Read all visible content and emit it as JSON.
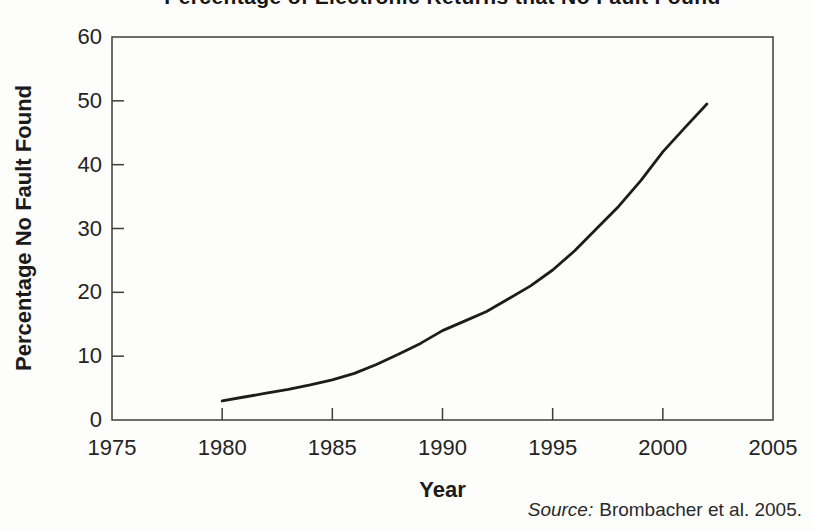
{
  "figure": {
    "kind": "scanned-book-line-chart"
  },
  "source": {
    "label": "Source:",
    "text": "Brombacher et al. 2005."
  },
  "chart_data": {
    "type": "line",
    "title": "Percentage of Electronic Returns that No Fault Found",
    "xlabel": "Year",
    "ylabel": "Percentage No Fault Found",
    "xlim": [
      1975,
      2005
    ],
    "ylim": [
      0,
      60
    ],
    "x_ticks": [
      1975,
      1980,
      1985,
      1990,
      1995,
      2000,
      2005
    ],
    "y_ticks": [
      0,
      10,
      20,
      30,
      40,
      50,
      60
    ],
    "grid": false,
    "legend": "none",
    "frame_color": "#3d3d3d",
    "line_color": "#1c1c1c",
    "series": [
      {
        "name": "Percentage No Fault Found",
        "points": [
          [
            1980,
            3.0
          ],
          [
            1981,
            3.6
          ],
          [
            1982,
            4.2
          ],
          [
            1983,
            4.8
          ],
          [
            1984,
            5.5
          ],
          [
            1985,
            6.3
          ],
          [
            1986,
            7.3
          ],
          [
            1987,
            8.7
          ],
          [
            1988,
            10.3
          ],
          [
            1989,
            12.0
          ],
          [
            1990,
            14.0
          ],
          [
            1991,
            15.5
          ],
          [
            1992,
            17.0
          ],
          [
            1993,
            19.0
          ],
          [
            1994,
            21.0
          ],
          [
            1995,
            23.5
          ],
          [
            1996,
            26.5
          ],
          [
            1997,
            30.0
          ],
          [
            1998,
            33.5
          ],
          [
            1999,
            37.5
          ],
          [
            2000,
            42.0
          ],
          [
            2001,
            45.8
          ],
          [
            2002,
            49.5
          ]
        ]
      }
    ]
  }
}
